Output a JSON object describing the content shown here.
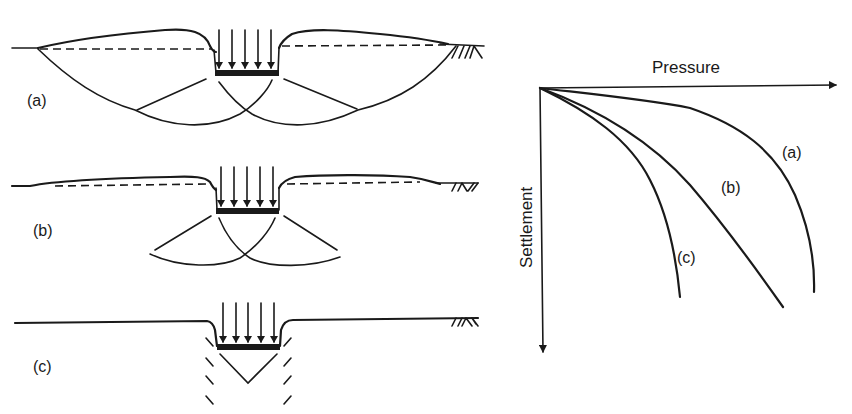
{
  "figure": {
    "panels": [
      {
        "id": "a",
        "label": "(a)",
        "mode": "General shear failure"
      },
      {
        "id": "b",
        "label": "(b)",
        "mode": "Local shear failure"
      },
      {
        "id": "c",
        "label": "(c)",
        "mode": "Punching shear failure"
      }
    ],
    "graph": {
      "x_axis_label": "Pressure",
      "y_axis_label": "Settlement",
      "curve_labels": [
        "(a)",
        "(b)",
        "(c)"
      ]
    }
  },
  "colors": {
    "ink": "#1a1a1a",
    "background": "#ffffff"
  }
}
